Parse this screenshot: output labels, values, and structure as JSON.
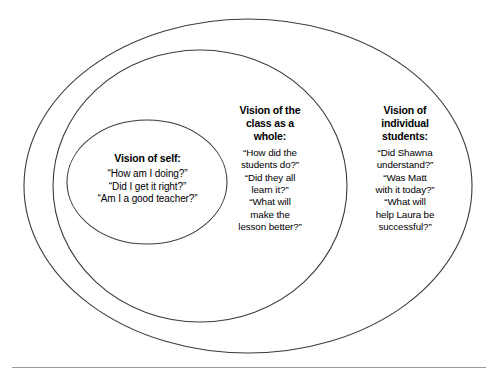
{
  "figure": {
    "type": "nested-ellipse-venn",
    "background_color": "#ffffff",
    "stroke_color": "#3b3b3b",
    "text_color": "#000000",
    "rule_color": "#9a9a9a"
  },
  "rings": {
    "inner": {
      "name": "vision-of-self",
      "title": "Vision of self:",
      "lines": [
        "“How am I doing?”",
        "“Did I get it right?”",
        "“Am I a good teacher?”"
      ]
    },
    "middle": {
      "name": "vision-of-class",
      "title": "Vision of the\nclass as a\nwhole:",
      "lines": [
        "“How did the",
        "students do?”",
        "“Did they all",
        "learn it?”",
        "“What will",
        "make the",
        "lesson better?”"
      ]
    },
    "outer": {
      "name": "vision-of-individual-students",
      "title": "Vision of\nindividual\nstudents:",
      "lines": [
        "“Did Shawna",
        "understand?”",
        "“Was Matt",
        "with it today?”",
        "“What will",
        "help Laura be",
        "successful?”"
      ]
    }
  }
}
